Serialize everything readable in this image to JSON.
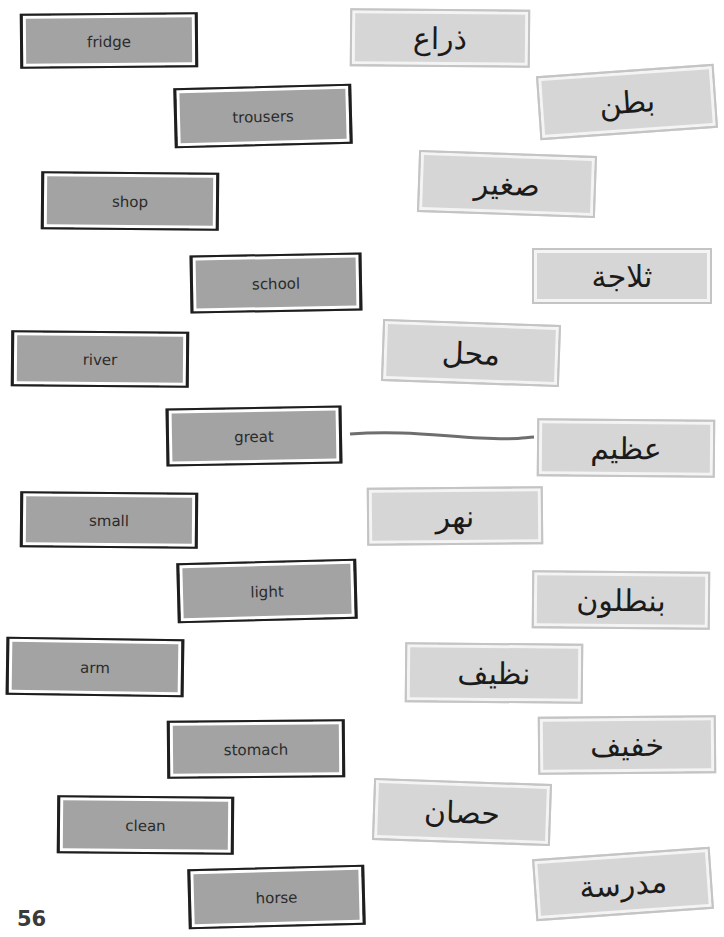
{
  "worksheet": {
    "english_cards": [
      {
        "label": "fridge"
      },
      {
        "label": "trousers"
      },
      {
        "label": "shop"
      },
      {
        "label": "school"
      },
      {
        "label": "river"
      },
      {
        "label": "great"
      },
      {
        "label": "small"
      },
      {
        "label": "light"
      },
      {
        "label": "arm"
      },
      {
        "label": "stomach"
      },
      {
        "label": "clean"
      },
      {
        "label": "horse"
      }
    ],
    "arabic_cards": [
      {
        "label": "ذراع"
      },
      {
        "label": "بطن"
      },
      {
        "label": "صغير"
      },
      {
        "label": "ثلاجة"
      },
      {
        "label": "محل"
      },
      {
        "label": "عظيم"
      },
      {
        "label": "نهر"
      },
      {
        "label": "بنطلون"
      },
      {
        "label": "نظيف"
      },
      {
        "label": "خفيف"
      },
      {
        "label": "حصان"
      },
      {
        "label": "مدرسة"
      }
    ],
    "example_match": {
      "english": "great",
      "arabic": "عظيم",
      "line_color": "#6e6e6e"
    },
    "page_number": "56"
  },
  "colors": {
    "english_card_fill": "#a3a3a3",
    "english_card_border": "#1e1e1e",
    "arabic_card_fill": "#d6d6d6",
    "arabic_card_border": "#c4c4c4"
  }
}
